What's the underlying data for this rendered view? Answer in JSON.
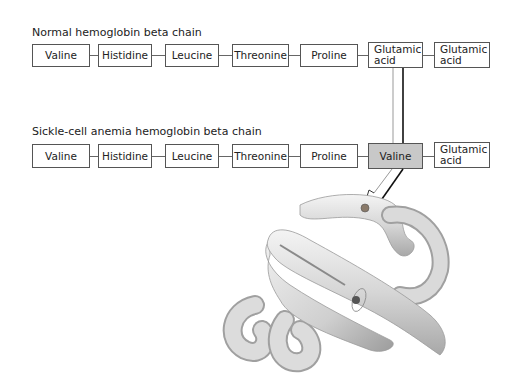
{
  "normal_chain": {
    "title": "Normal hemoglobin beta chain",
    "residues": [
      {
        "label": "Valine"
      },
      {
        "label": "Histidine"
      },
      {
        "label": "Leucine"
      },
      {
        "label": "Threonine"
      },
      {
        "label": "Proline"
      },
      {
        "label": "Glutamic acid",
        "line1": "Glutamic",
        "line2": "acid"
      },
      {
        "label": "Glutamic acid",
        "line1": "Glutamic",
        "line2": "acid"
      }
    ]
  },
  "sickle_chain": {
    "title": "Sickle-cell anemia hemoglobin beta chain",
    "residues": [
      {
        "label": "Valine"
      },
      {
        "label": "Histidine"
      },
      {
        "label": "Leucine"
      },
      {
        "label": "Threonine"
      },
      {
        "label": "Proline"
      },
      {
        "label": "Valine",
        "highlighted": true
      },
      {
        "label": "Glutamic acid",
        "line1": "Glutamic",
        "line2": "acid"
      }
    ]
  },
  "colors": {
    "highlight": "#c8c8c8",
    "border": "#555555",
    "protein": "#d8d8d8"
  },
  "illustration": {
    "name": "folded beta chain protein structure"
  }
}
